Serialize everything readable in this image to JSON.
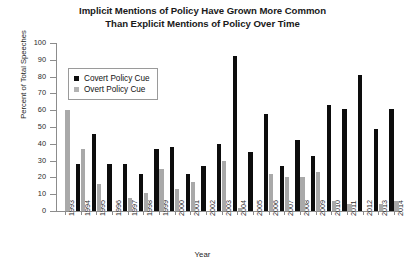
{
  "chart_data": {
    "type": "bar",
    "title": "Implicit Mentions of Policy Have Grown More Common Than Explicit Mentions of Policy Over Time",
    "title_line1": "Implicit Mentions of Policy Have Grown More Common",
    "title_line2": "Than Explicit Mentions of Policy Over Time",
    "xlabel": "Year",
    "ylabel": "Percent of Total Speeches",
    "ylim": [
      0,
      100
    ],
    "ytick_labels": [
      "0",
      "10",
      "20",
      "30",
      "40",
      "50",
      "60",
      "70",
      "80",
      "90",
      "100"
    ],
    "ytick_values": [
      0,
      10,
      20,
      30,
      40,
      50,
      60,
      70,
      80,
      90,
      100
    ],
    "grid": false,
    "legend_position": "top-left",
    "categories": [
      "1993",
      "1994",
      "1995",
      "1996",
      "1997",
      "1998",
      "1999",
      "2000",
      "2001",
      "2002",
      "2003",
      "2004",
      "2005",
      "2006",
      "2007",
      "2008",
      "2009",
      "2010",
      "2011",
      "2012",
      "2013",
      "2014"
    ],
    "series": [
      {
        "name": "Covert Policy Cue",
        "color": "#0d0d0d",
        "values": [
          0,
          28,
          46,
          28,
          28,
          22,
          37,
          38,
          22,
          27,
          40,
          92,
          35,
          58,
          27,
          42,
          33,
          63,
          61,
          81,
          49,
          61
        ]
      },
      {
        "name": "Overt Policy Cue",
        "color": "#a9a9a9",
        "values": [
          60,
          37,
          16,
          0,
          8,
          11,
          25,
          13,
          17,
          0,
          30,
          2,
          0,
          22,
          20,
          20,
          23,
          6,
          4,
          0,
          4,
          6
        ]
      }
    ]
  },
  "legend": {
    "items": [
      {
        "label": "Covert Policy Cue"
      },
      {
        "label": "Overt Policy Cue"
      }
    ]
  }
}
